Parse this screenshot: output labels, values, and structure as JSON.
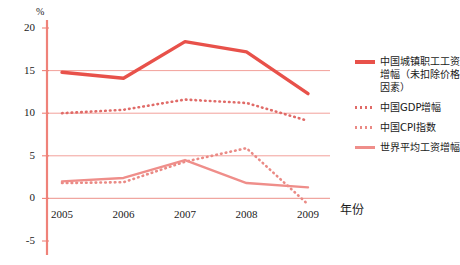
{
  "chart_data": {
    "type": "line",
    "title": "",
    "xlabel": "年份",
    "ylabel": "%",
    "x": [
      "2005",
      "2006",
      "2007",
      "2008",
      "2009"
    ],
    "categories": [
      "2005",
      "2006",
      "2007",
      "2008",
      "2009"
    ],
    "ylim": [
      -5,
      20
    ],
    "yticks": [
      "20",
      "15",
      "10",
      "5",
      "0",
      "-5"
    ],
    "ytick_values": [
      20,
      15,
      10,
      5,
      0,
      -5
    ],
    "grid": "horizontal-gridlines-at-0-5-10-15",
    "legend_position": "right",
    "series": [
      {
        "name": "中国城镇职工工资增幅（未扣除价格因素）",
        "style": "solid-thick",
        "color": "#e8514a",
        "values": [
          14.8,
          14.1,
          18.4,
          17.2,
          12.3
        ]
      },
      {
        "name": "中国GDP增幅",
        "style": "dotted",
        "color": "#e06b68",
        "values": [
          10.0,
          10.4,
          11.6,
          11.2,
          9.1
        ]
      },
      {
        "name": "中国CPI指数",
        "style": "dotted",
        "color": "#ea8a85",
        "values": [
          1.8,
          1.9,
          4.3,
          5.9,
          -0.7
        ]
      },
      {
        "name": "世界平均工资增幅",
        "style": "solid-light",
        "color": "#ef8e8a",
        "values": [
          2.0,
          2.4,
          4.5,
          1.8,
          1.3
        ]
      }
    ]
  },
  "axis": {
    "unit_label": "%",
    "x_title": "年份"
  },
  "legend": {
    "items": [
      {
        "label": "中国城镇职工工资增幅（未扣除价格因素）",
        "style": "solid-thick",
        "color": "#e8514a"
      },
      {
        "label": "中国GDP增幅",
        "style": "dotted",
        "color": "#e06b68"
      },
      {
        "label": "中国CPI指数",
        "style": "dotted",
        "color": "#ea8a85"
      },
      {
        "label": "世界平均工资增幅",
        "style": "solid-light",
        "color": "#ef8e8a"
      }
    ]
  },
  "colors": {
    "axis": "#ef8279",
    "gridline": "#f2a09a",
    "zero_line": "#f0a6a0",
    "background": "#ffffff",
    "text": "#1a1a1a"
  }
}
